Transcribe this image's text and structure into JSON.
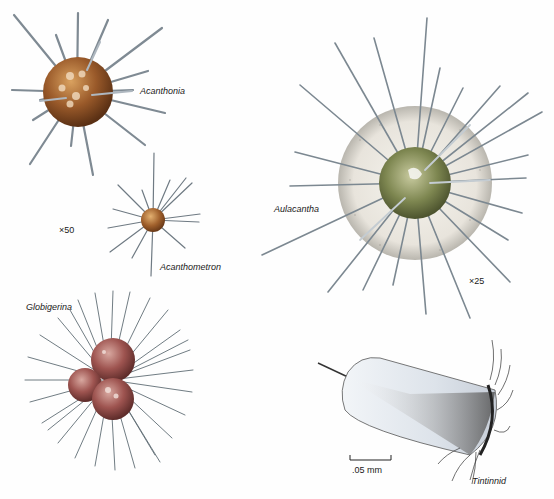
{
  "figure": {
    "labels": {
      "acanthonia": "Acanthonia",
      "acanthometron": "Acanthometron",
      "aulacantha": "Aulacantha",
      "globigerina": "Globigerina",
      "tintinnid": "Tintinnid"
    },
    "magnifications": {
      "left": "×50",
      "right": "×25"
    },
    "scale_bar": {
      "label": ".05 mm"
    },
    "colors": {
      "acanthonia_body": "#9a5a2a",
      "acanthometron_body": "#a0602c",
      "aulacantha_capsule": "#7d8650",
      "aulacantha_halo": "#eeeae2",
      "globigerina_chambers": "#9e5450",
      "spines": "#8c97a0",
      "tintinnid_lorica": "#dde3ea"
    }
  }
}
